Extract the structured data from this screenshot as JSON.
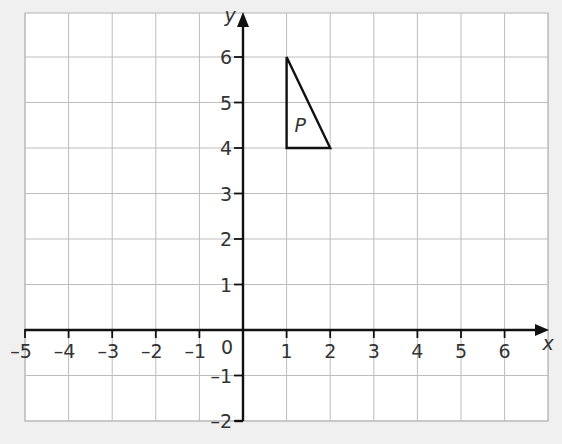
{
  "figure": {
    "background": "#f0f0f0",
    "grid_background": "#ffffff",
    "grid_color": "#bdbdbd",
    "axis_color": "#111111",
    "x_axis": {
      "label": "x",
      "min": -5,
      "max": 7,
      "ticks": [
        "-5",
        "-4",
        "-3",
        "-2",
        "-1",
        "1",
        "2",
        "3",
        "4",
        "5",
        "6"
      ],
      "tick_values": [
        -5,
        -4,
        -3,
        -2,
        -1,
        1,
        2,
        3,
        4,
        5,
        6
      ]
    },
    "y_axis": {
      "label": "y",
      "min": -2,
      "max": 6.9,
      "ticks": [
        "-2",
        "-1",
        "1",
        "2",
        "3",
        "4",
        "5",
        "6"
      ],
      "tick_values": [
        -2,
        -1,
        1,
        2,
        3,
        4,
        5,
        6
      ]
    },
    "origin_label": "0",
    "shapes": [
      {
        "label": "P",
        "type": "triangle",
        "vertices": [
          [
            1,
            6
          ],
          [
            1,
            4
          ],
          [
            2,
            4
          ]
        ]
      }
    ]
  }
}
